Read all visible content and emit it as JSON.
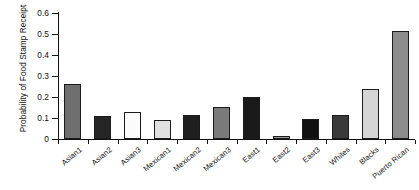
{
  "chart_data": {
    "type": "bar",
    "title": "",
    "xlabel": "",
    "ylabel": "Probability of Food Stamp Receipt",
    "ylim": [
      0,
      0.6
    ],
    "ytick_labels": [
      "0",
      "0.1",
      "0.2",
      "0.3",
      "0.4",
      "0.5",
      "0.6"
    ],
    "ytick_values": [
      0,
      0.1,
      0.2,
      0.3,
      0.4,
      0.5,
      0.6
    ],
    "grid": false,
    "legend": null,
    "categories": [
      "Asian1",
      "Asian2",
      "Asian3",
      "Mexican1",
      "Mexican2",
      "Mexican3",
      "East1",
      "East2",
      "East3",
      "Whites",
      "Blacks",
      "Puerto Rican"
    ],
    "values": [
      0.26,
      0.11,
      0.13,
      0.09,
      0.115,
      0.153,
      0.2,
      0.016,
      0.097,
      0.112,
      0.24,
      0.515
    ],
    "bar_colors": [
      "#6e6e6e",
      "#262626",
      "#fbfbfb",
      "#e0e0e0",
      "#1f1f1f",
      "#7a7a7a",
      "#1a1a1a",
      "#9a9a9a",
      "#111111",
      "#3a3a3a",
      "#d5d5d5",
      "#8c8c8c"
    ],
    "bar_edge_color": "#1b1b1b",
    "background_color": "#ffffff",
    "axis_color": "#111111"
  }
}
